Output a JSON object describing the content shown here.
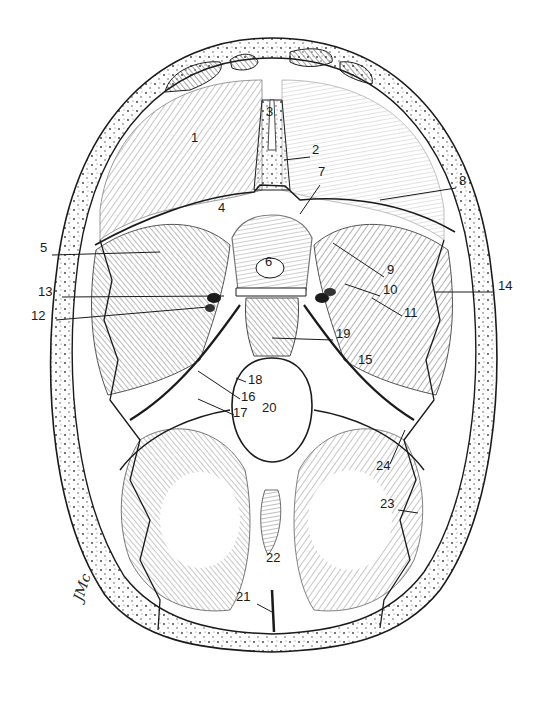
{
  "figure": {
    "signature": "JMc",
    "colors": {
      "ink": "#1a1a1a",
      "paper": "#ffffff",
      "shade": "#6b6b6b"
    },
    "labels": [
      {
        "n": "1",
        "x": 191,
        "y": 138,
        "leader": null
      },
      {
        "n": "2",
        "x": 312,
        "y": 150,
        "leader": [
          310,
          157,
          284,
          160
        ]
      },
      {
        "n": "3",
        "x": 266,
        "y": 112,
        "leader": null
      },
      {
        "n": "4",
        "x": 218,
        "y": 208,
        "leader": null
      },
      {
        "n": "5",
        "x": 40,
        "y": 248,
        "leader": [
          52,
          255,
          160,
          252
        ]
      },
      {
        "n": "6",
        "x": 265,
        "y": 262,
        "leader": null
      },
      {
        "n": "7",
        "x": 318,
        "y": 172,
        "leader": [
          320,
          185,
          300,
          214
        ]
      },
      {
        "n": "8",
        "x": 459,
        "y": 181,
        "leader": [
          456,
          188,
          380,
          200
        ]
      },
      {
        "n": "9",
        "x": 387,
        "y": 270,
        "leader": [
          384,
          277,
          333,
          243
        ]
      },
      {
        "n": "10",
        "x": 383,
        "y": 290,
        "leader": [
          380,
          296,
          345,
          284
        ]
      },
      {
        "n": "11",
        "x": 404,
        "y": 313,
        "leader": [
          402,
          316,
          372,
          298
        ]
      },
      {
        "n": "12",
        "x": 31,
        "y": 316,
        "leader": [
          56,
          320,
          208,
          307
        ]
      },
      {
        "n": "13",
        "x": 38,
        "y": 292,
        "leader": [
          62,
          297,
          224,
          296
        ]
      },
      {
        "n": "14",
        "x": 498,
        "y": 286,
        "leader": [
          494,
          292,
          434,
          292
        ]
      },
      {
        "n": "15",
        "x": 358,
        "y": 360,
        "leader": null
      },
      {
        "n": "16",
        "x": 241,
        "y": 397,
        "leader": [
          240,
          399,
          198,
          371
        ]
      },
      {
        "n": "17",
        "x": 233,
        "y": 413,
        "leader": [
          234,
          415,
          198,
          399
        ]
      },
      {
        "n": "18",
        "x": 248,
        "y": 380,
        "leader": [
          246,
          382,
          236,
          378
        ]
      },
      {
        "n": "19",
        "x": 336,
        "y": 334,
        "leader": [
          333,
          340,
          272,
          338
        ]
      },
      {
        "n": "20",
        "x": 262,
        "y": 408,
        "leader": null
      },
      {
        "n": "21",
        "x": 236,
        "y": 597,
        "leader": [
          257,
          604,
          272,
          612
        ]
      },
      {
        "n": "22",
        "x": 266,
        "y": 558,
        "leader": [
          280,
          570,
          280,
          590
        ]
      },
      {
        "n": "23",
        "x": 380,
        "y": 504,
        "leader": [
          398,
          510,
          418,
          513
        ]
      },
      {
        "n": "24",
        "x": 376,
        "y": 466,
        "leader": [
          390,
          464,
          405,
          430
        ]
      }
    ]
  }
}
